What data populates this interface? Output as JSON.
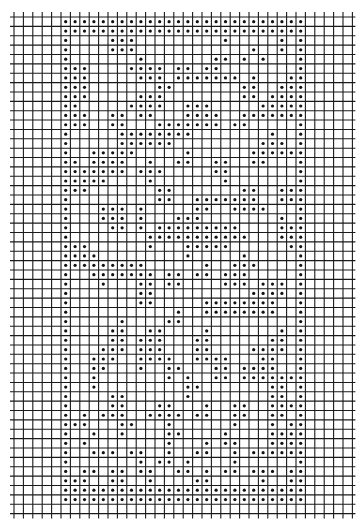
{
  "chart_data": {
    "type": "filet-crochet-chart",
    "grid": {
      "columns": 36,
      "rows": 53,
      "pattern_col_offset": 5,
      "pattern_columns": 26,
      "pattern_rows": 52
    },
    "filled_cells_by_row": [
      [
        0,
        1,
        2,
        3,
        4,
        5,
        6,
        7,
        8,
        9,
        10,
        11,
        12,
        13,
        14,
        15,
        16,
        17,
        18,
        19,
        20,
        21,
        22,
        23,
        24,
        25
      ],
      [
        0,
        1,
        2,
        3,
        4,
        5,
        6,
        7,
        8,
        9,
        10,
        11,
        12,
        13,
        14,
        15,
        16,
        17,
        18,
        19,
        20,
        21,
        22,
        23,
        24,
        25
      ],
      [
        0,
        5,
        6,
        7,
        17,
        23,
        25
      ],
      [
        0,
        5,
        6,
        7,
        20,
        23,
        25
      ],
      [
        0,
        8,
        16,
        17,
        19,
        21,
        25
      ],
      [
        0,
        1,
        2,
        7,
        8,
        9,
        10,
        12,
        13,
        15,
        16,
        25
      ],
      [
        0,
        1,
        2,
        8,
        9,
        10,
        12,
        13,
        14,
        15,
        16,
        17,
        18,
        20,
        24,
        25
      ],
      [
        0,
        1,
        2,
        10,
        11,
        19,
        20,
        23,
        24,
        25
      ],
      [
        0,
        1,
        2,
        8,
        9,
        10,
        19,
        20,
        22,
        23,
        24,
        25
      ],
      [
        0,
        1,
        7,
        8,
        9,
        10,
        13,
        14,
        15,
        21,
        22,
        23,
        24,
        25
      ],
      [
        0,
        1,
        2,
        5,
        6,
        8,
        9,
        13,
        14,
        15,
        16,
        19,
        20,
        21,
        22,
        23,
        24,
        25
      ],
      [
        0,
        1,
        2,
        5,
        6,
        10,
        11,
        12,
        13,
        14,
        15,
        16,
        18,
        19,
        25
      ],
      [
        0,
        6,
        7,
        8,
        9,
        10,
        11,
        12,
        13,
        22,
        25
      ],
      [
        0,
        6,
        7,
        8,
        9,
        10,
        11,
        21,
        22,
        23,
        25
      ],
      [
        0,
        3,
        4,
        5,
        6,
        7,
        13,
        20,
        21,
        22,
        23,
        24,
        25
      ],
      [
        0,
        1,
        3,
        4,
        5,
        6,
        9,
        12,
        13,
        16,
        17,
        20,
        21,
        25
      ],
      [
        0,
        1,
        2,
        3,
        4,
        5,
        6,
        8,
        9,
        10,
        16,
        17,
        25
      ],
      [
        0,
        1,
        2,
        3,
        4,
        9,
        17,
        25
      ],
      [
        0,
        1,
        2,
        10,
        11,
        19,
        20,
        23,
        24,
        25
      ],
      [
        0,
        10,
        11,
        14,
        15,
        16,
        17,
        18,
        19,
        20,
        23,
        24,
        25
      ],
      [
        0,
        4,
        5,
        6,
        8,
        14,
        15,
        18,
        19,
        20,
        21,
        25
      ],
      [
        0,
        4,
        5,
        6,
        8,
        12,
        13,
        14,
        23,
        25
      ],
      [
        0,
        5,
        6,
        8,
        10,
        11,
        12,
        13,
        14,
        15,
        16,
        17,
        18,
        23,
        24,
        25
      ],
      [
        0,
        9,
        10,
        11,
        12,
        13,
        14,
        15,
        16,
        17,
        18,
        19,
        23,
        24,
        25
      ],
      [
        0,
        1,
        2,
        9,
        13,
        14,
        15,
        16,
        17,
        24,
        25
      ],
      [
        0,
        1,
        2,
        3,
        13,
        19,
        25
      ],
      [
        0,
        1,
        2,
        3,
        4,
        5,
        6,
        7,
        8,
        15,
        18,
        19,
        20,
        25
      ],
      [
        0,
        3,
        4,
        5,
        6,
        7,
        8,
        9,
        11,
        12,
        14,
        15,
        17,
        18,
        19,
        25
      ],
      [
        0,
        4,
        8,
        9,
        11,
        12,
        17,
        18,
        19,
        21,
        22,
        23,
        25
      ],
      [
        0,
        8,
        9,
        20,
        21,
        22,
        23,
        25
      ],
      [
        0,
        8,
        9,
        15,
        16,
        17,
        18,
        19,
        20,
        21,
        22,
        25
      ],
      [
        0,
        12,
        15,
        16,
        17,
        18,
        19,
        20,
        21,
        22,
        25
      ],
      [
        0,
        6,
        11,
        12,
        25
      ],
      [
        0,
        5,
        6,
        9,
        10,
        15,
        23,
        25
      ],
      [
        0,
        5,
        6,
        8,
        9,
        10,
        14,
        15,
        22,
        23,
        25
      ],
      [
        0,
        4,
        5,
        6,
        8,
        9,
        10,
        14,
        15,
        20,
        21,
        22,
        23,
        25
      ],
      [
        0,
        3,
        4,
        5,
        8,
        9,
        10,
        11,
        14,
        15,
        16,
        17,
        21,
        22,
        25
      ],
      [
        0,
        3,
        4,
        8,
        11,
        12,
        16,
        17,
        19,
        20,
        21,
        22,
        25
      ],
      [
        0,
        3,
        11,
        13,
        16,
        17,
        19,
        20,
        21,
        22,
        23,
        24,
        25
      ],
      [
        0,
        3,
        13,
        14,
        22,
        23,
        25
      ],
      [
        0,
        5,
        6,
        13,
        22,
        23,
        25
      ],
      [
        0,
        5,
        6,
        10,
        11,
        15,
        18,
        19,
        22,
        23,
        24,
        25
      ],
      [
        0,
        2,
        4,
        5,
        6,
        9,
        10,
        11,
        12,
        14,
        15,
        18,
        19,
        22,
        23,
        25
      ],
      [
        0,
        1,
        2,
        6,
        7,
        11,
        18,
        22,
        24,
        25
      ],
      [
        0,
        3,
        6,
        11,
        12,
        17,
        22,
        23,
        24,
        25
      ],
      [
        0,
        2,
        11,
        15,
        17,
        18,
        22,
        23,
        24,
        25
      ],
      [
        0,
        3,
        4,
        5,
        7,
        8,
        11,
        14,
        15,
        18,
        20,
        21,
        22,
        23,
        24,
        25
      ],
      [
        0,
        8,
        10,
        11,
        13,
        18,
        25
      ],
      [
        0,
        2,
        3,
        5,
        6,
        8,
        9,
        12,
        13,
        15,
        17,
        18,
        20,
        21,
        22,
        24,
        25
      ],
      [
        0,
        1,
        2,
        5,
        6,
        9,
        14,
        15,
        21,
        24,
        25
      ],
      [
        0,
        1,
        2,
        3,
        4,
        5,
        6,
        7,
        8,
        9,
        10,
        11,
        12,
        13,
        14,
        15,
        16,
        17,
        18,
        19,
        20,
        21,
        22,
        23,
        24,
        25
      ],
      [
        0,
        1,
        2,
        3,
        4,
        5,
        6,
        7,
        8,
        9,
        10,
        11,
        12,
        13,
        14,
        15,
        16,
        17,
        18,
        19,
        20,
        21,
        22,
        23,
        24,
        25
      ]
    ],
    "colors": {
      "grid": "#1a1a1a",
      "dot": "#111111",
      "background": "#ffffff"
    }
  }
}
